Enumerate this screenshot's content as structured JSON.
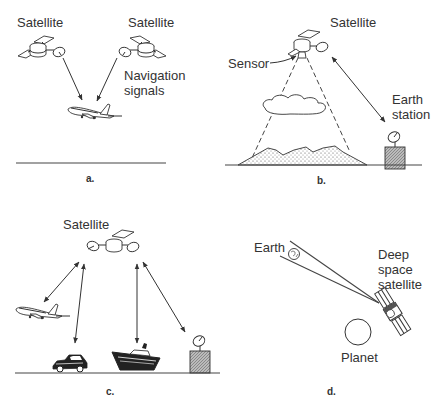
{
  "figure": {
    "panels": [
      {
        "id": "a",
        "caption": "a.",
        "labels": {
          "satellite_left": "Satellite",
          "satellite_right": "Satellite",
          "signals_line1": "Navigation",
          "signals_line2": "signals"
        },
        "elements": [
          "satellite-icon",
          "satellite-icon",
          "airplane-icon",
          "ground-line"
        ]
      },
      {
        "id": "b",
        "caption": "b.",
        "labels": {
          "satellite": "Satellite",
          "sensor": "Sensor",
          "earth_station_line1": "Earth",
          "earth_station_line2": "station"
        },
        "elements": [
          "satellite-icon",
          "sensor-cone",
          "cloud-icon",
          "mountain-terrain",
          "earth-station-icon",
          "ground-line"
        ]
      },
      {
        "id": "c",
        "caption": "c.",
        "labels": {
          "satellite": "Satellite"
        },
        "elements": [
          "satellite-icon",
          "airplane-icon",
          "car-icon",
          "ship-icon",
          "earth-station-icon",
          "ground-line"
        ]
      },
      {
        "id": "d",
        "caption": "d.",
        "labels": {
          "earth": "Earth",
          "satellite_line1": "Deep",
          "satellite_line2": "space",
          "satellite_line3": "satellite",
          "planet": "Planet"
        },
        "elements": [
          "earth-icon",
          "deep-space-satellite-icon",
          "planet-icon"
        ]
      }
    ]
  }
}
